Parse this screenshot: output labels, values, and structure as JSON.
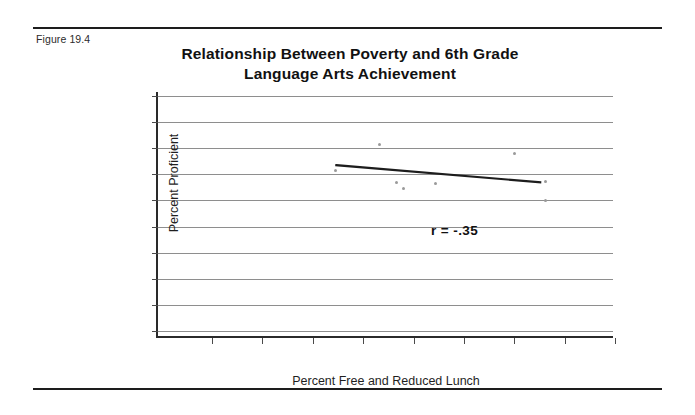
{
  "figure": {
    "label": "Figure 19.4"
  },
  "chart_data": {
    "type": "scatter",
    "title": "Relationship Between Poverty and 6th Grade Language Arts Achievement",
    "title_line1": "Relationship Between Poverty and 6th Grade",
    "title_line2": "Language Arts Achievement",
    "xlabel": "Percent Free and Reduced Lunch",
    "ylabel": "Percent Proficient",
    "annotation": "r = -.35",
    "correlation": -0.35,
    "grid": true,
    "gridlines_count": 10,
    "legend": "none",
    "xticks_count": 9,
    "yticks_count": 10,
    "xtick_labels": [],
    "ytick_labels": [],
    "xlim": [
      0,
      100
    ],
    "ylim": [
      0,
      100
    ],
    "point_color": "#9a9a9a",
    "line_color": "#1d1d1d",
    "grid_color": "#8e8e8e",
    "axis_color": "#2a2a2a",
    "points": [
      {
        "x": 39.0,
        "y": 68.0
      },
      {
        "x": 48.6,
        "y": 78.5
      },
      {
        "x": 52.4,
        "y": 63.0
      },
      {
        "x": 54.0,
        "y": 60.5
      },
      {
        "x": 61.0,
        "y": 62.5
      },
      {
        "x": 78.3,
        "y": 75.0
      },
      {
        "x": 85.1,
        "y": 63.5
      },
      {
        "x": 85.1,
        "y": 55.5
      }
    ],
    "trendline": {
      "x1": 39.2,
      "y1": 70.0,
      "x2": 84.0,
      "y2": 63.0
    }
  }
}
